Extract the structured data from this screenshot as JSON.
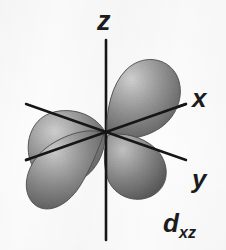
{
  "figure": {
    "background_color": "#fcfcfc",
    "width": 226,
    "height": 250
  },
  "axes": {
    "line_color": "#161616",
    "labels": {
      "z": "z",
      "x": "x",
      "y": "y"
    }
  },
  "orbital": {
    "label_main": "d",
    "label_sub": "xz",
    "lobe_count": 4,
    "lobe_fill_light": "#c9c9c9",
    "lobe_fill_mid": "#8d8d8d",
    "lobe_fill_dark": "#5f5f5f",
    "lobe_edge_color": "#4a4a4a",
    "lobes": [
      {
        "name": "upper-left-lobe"
      },
      {
        "name": "upper-right-lobe"
      },
      {
        "name": "lower-left-lobe"
      },
      {
        "name": "lower-right-lobe"
      }
    ]
  }
}
